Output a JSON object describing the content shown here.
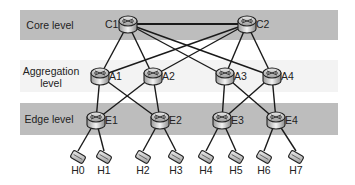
{
  "diagram": {
    "levels": [
      {
        "id": "core",
        "label": "Core level",
        "color": "#bdbdbd"
      },
      {
        "id": "aggregation",
        "label_line1": "Aggregation",
        "label_line2": "level",
        "color": "#f3f3f3"
      },
      {
        "id": "edge",
        "label": "Edge level",
        "color": "#bdbdbd"
      }
    ],
    "nodes": {
      "core": [
        {
          "id": "C1",
          "label": "C1",
          "x": 128,
          "y": 24
        },
        {
          "id": "C2",
          "label": "C2",
          "x": 247,
          "y": 24
        }
      ],
      "aggregation": [
        {
          "id": "A1",
          "label": "A1",
          "x": 100,
          "y": 76
        },
        {
          "id": "A2",
          "label": "A2",
          "x": 153,
          "y": 76
        },
        {
          "id": "A3",
          "label": "A3",
          "x": 225,
          "y": 76
        },
        {
          "id": "A4",
          "label": "A4",
          "x": 272,
          "y": 76
        }
      ],
      "edge": [
        {
          "id": "E1",
          "label": "E1",
          "x": 96,
          "y": 120
        },
        {
          "id": "E2",
          "label": "E2",
          "x": 160,
          "y": 120
        },
        {
          "id": "E3",
          "label": "E3",
          "x": 222,
          "y": 120
        },
        {
          "id": "E4",
          "label": "E4",
          "x": 276,
          "y": 120
        }
      ],
      "hosts": [
        {
          "id": "H0",
          "label": "H0",
          "x": 78,
          "y": 157
        },
        {
          "id": "H1",
          "label": "H1",
          "x": 104,
          "y": 157
        },
        {
          "id": "H2",
          "label": "H2",
          "x": 143,
          "y": 157
        },
        {
          "id": "H3",
          "label": "H3",
          "x": 176,
          "y": 157
        },
        {
          "id": "H4",
          "label": "H4",
          "x": 206,
          "y": 157
        },
        {
          "id": "H5",
          "label": "H5",
          "x": 236,
          "y": 157
        },
        {
          "id": "H6",
          "label": "H6",
          "x": 264,
          "y": 157
        },
        {
          "id": "H7",
          "label": "H7",
          "x": 296,
          "y": 157
        }
      ]
    },
    "links": [
      [
        "C1",
        "C2"
      ],
      [
        "C1",
        "A1"
      ],
      [
        "C1",
        "A2"
      ],
      [
        "C1",
        "A3"
      ],
      [
        "C1",
        "A4"
      ],
      [
        "C2",
        "A1"
      ],
      [
        "C2",
        "A2"
      ],
      [
        "C2",
        "A3"
      ],
      [
        "C2",
        "A4"
      ],
      [
        "A1",
        "E1"
      ],
      [
        "A1",
        "E2"
      ],
      [
        "A2",
        "E1"
      ],
      [
        "A2",
        "E2"
      ],
      [
        "A3",
        "E3"
      ],
      [
        "A3",
        "E4"
      ],
      [
        "A4",
        "E3"
      ],
      [
        "A4",
        "E4"
      ],
      [
        "E1",
        "H0"
      ],
      [
        "E1",
        "H1"
      ],
      [
        "E2",
        "H2"
      ],
      [
        "E2",
        "H3"
      ],
      [
        "E3",
        "H4"
      ],
      [
        "E3",
        "H5"
      ],
      [
        "E4",
        "H6"
      ],
      [
        "E4",
        "H7"
      ]
    ],
    "icons": {
      "switch": "router-icon",
      "host": "host-icon"
    }
  }
}
